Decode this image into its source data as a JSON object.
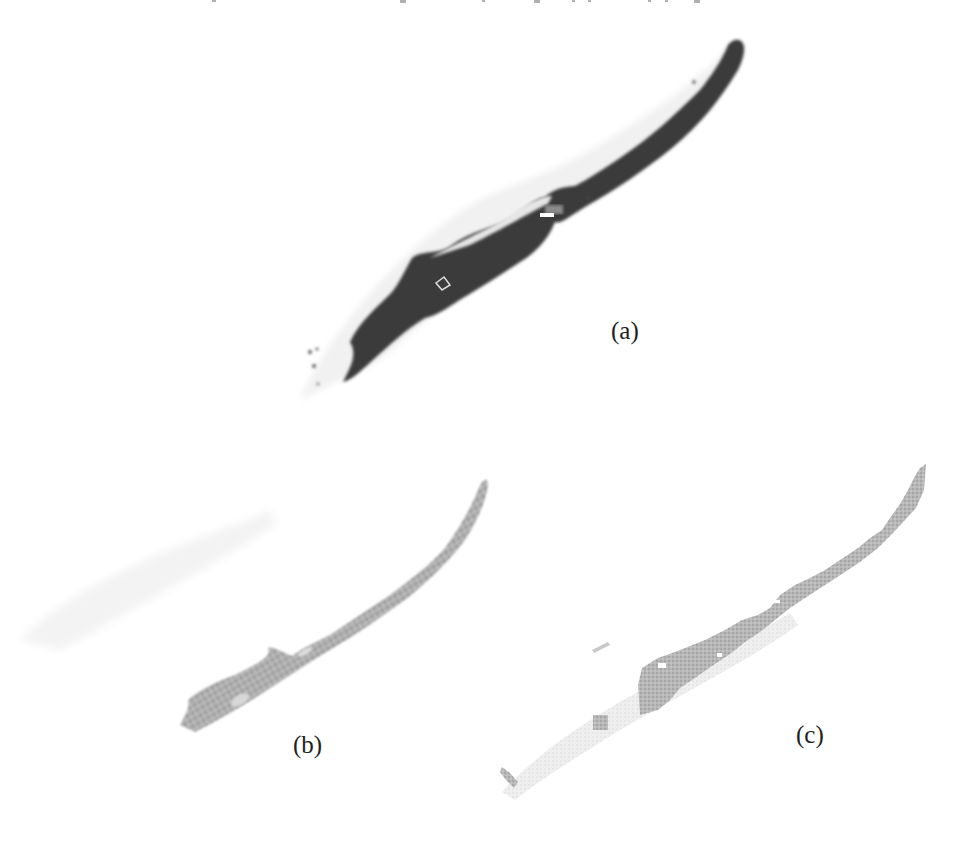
{
  "figure": {
    "panels": [
      {
        "id": "a",
        "label": "(a)",
        "description": "dark elongated diagonal region",
        "fill": "#3a3a3a"
      },
      {
        "id": "b",
        "label": "(b)",
        "description": "grey textured elongated region",
        "fill": "#a9a9a9"
      },
      {
        "id": "c",
        "label": "(c)",
        "description": "grey pixelated region with faint envelope",
        "fill": "#b3b3b3",
        "envelope_fill": "#ececec"
      }
    ]
  }
}
